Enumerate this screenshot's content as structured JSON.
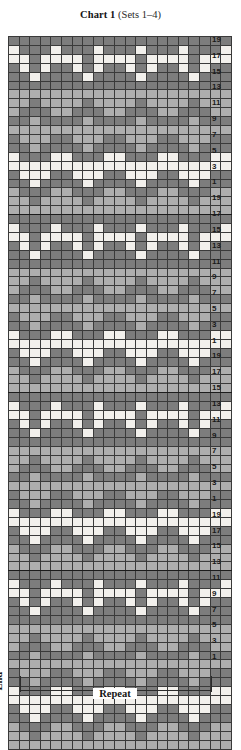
{
  "title": {
    "main": "Chart 1",
    "sub": "(Sets 1–4)"
  },
  "legend": {
    "end_label": "End",
    "repeat_label": "Repeat"
  },
  "colors": {
    "light": "#f2f0ec",
    "medium": "#aeaeae",
    "dark": "#7d7d7d",
    "grid_line": "#3a3a3a",
    "border": "#2b2b2b",
    "text": "#141414"
  },
  "chart_data": {
    "type": "heatmap",
    "title": "Chart 1 (Sets 1–4)",
    "xlabel": "",
    "ylabel": "",
    "columns": 21,
    "rows": 80,
    "sets": 4,
    "rows_per_set": 20,
    "stitch_repeat": 6,
    "palette": [
      "#f2f0ec",
      "#aeaeae",
      "#7d7d7d"
    ],
    "palette_names": [
      "light",
      "medium",
      "dark"
    ],
    "row_number_labels": [
      19,
      17,
      15,
      13,
      11,
      9,
      7,
      5,
      3,
      1
    ],
    "grid": "on",
    "legend_position": "bottom",
    "annotations": [
      "End",
      "Repeat"
    ],
    "set_pattern": [
      [
        2,
        2,
        2,
        2,
        2,
        2,
        2,
        2,
        2,
        2,
        2,
        2,
        2,
        2,
        2,
        2,
        2,
        2,
        2,
        2,
        2
      ],
      [
        0,
        2,
        2,
        2,
        0,
        2,
        2,
        2,
        0,
        2,
        2,
        2,
        0,
        2,
        2,
        2,
        0,
        2,
        2,
        2,
        0
      ],
      [
        0,
        0,
        2,
        0,
        0,
        0,
        0,
        2,
        0,
        0,
        0,
        0,
        2,
        0,
        0,
        0,
        0,
        2,
        0,
        0,
        0
      ],
      [
        2,
        0,
        2,
        0,
        2,
        2,
        0,
        2,
        0,
        2,
        2,
        0,
        2,
        0,
        2,
        2,
        0,
        2,
        0,
        2,
        2
      ],
      [
        2,
        2,
        0,
        2,
        2,
        2,
        2,
        0,
        2,
        2,
        2,
        2,
        0,
        2,
        2,
        2,
        2,
        0,
        2,
        2,
        2
      ],
      [
        2,
        2,
        2,
        2,
        2,
        2,
        2,
        2,
        2,
        2,
        2,
        2,
        2,
        2,
        2,
        2,
        2,
        2,
        2,
        2,
        2
      ],
      [
        1,
        1,
        1,
        1,
        1,
        1,
        1,
        1,
        1,
        1,
        1,
        1,
        1,
        1,
        1,
        1,
        1,
        1,
        1,
        1,
        1
      ],
      [
        1,
        1,
        2,
        1,
        1,
        1,
        1,
        2,
        1,
        1,
        1,
        1,
        2,
        1,
        1,
        1,
        1,
        2,
        1,
        1,
        1
      ],
      [
        1,
        2,
        2,
        2,
        1,
        1,
        2,
        2,
        2,
        1,
        1,
        2,
        2,
        2,
        1,
        1,
        2,
        2,
        2,
        1,
        1
      ],
      [
        2,
        2,
        1,
        2,
        2,
        2,
        2,
        1,
        2,
        2,
        2,
        2,
        1,
        2,
        2,
        2,
        2,
        1,
        2,
        2,
        2
      ],
      [
        1,
        1,
        1,
        1,
        1,
        1,
        1,
        1,
        1,
        1,
        1,
        1,
        1,
        1,
        1,
        1,
        1,
        1,
        1,
        1,
        1
      ],
      [
        2,
        1,
        1,
        1,
        2,
        2,
        1,
        1,
        1,
        2,
        2,
        1,
        1,
        1,
        2,
        2,
        1,
        1,
        1,
        2,
        2
      ],
      [
        2,
        2,
        1,
        2,
        2,
        2,
        2,
        1,
        2,
        2,
        2,
        2,
        1,
        2,
        2,
        2,
        2,
        1,
        2,
        2,
        2
      ],
      [
        0,
        2,
        2,
        2,
        0,
        0,
        2,
        2,
        2,
        0,
        0,
        2,
        2,
        2,
        0,
        0,
        2,
        2,
        2,
        0,
        0
      ],
      [
        0,
        0,
        0,
        0,
        0,
        0,
        0,
        0,
        0,
        0,
        0,
        0,
        0,
        0,
        0,
        0,
        0,
        0,
        0,
        0,
        0
      ],
      [
        2,
        0,
        0,
        0,
        2,
        2,
        0,
        0,
        0,
        2,
        2,
        0,
        0,
        0,
        2,
        2,
        0,
        0,
        0,
        2,
        2
      ],
      [
        2,
        2,
        0,
        2,
        2,
        2,
        2,
        0,
        2,
        2,
        2,
        2,
        0,
        2,
        2,
        2,
        2,
        0,
        2,
        2,
        2
      ],
      [
        1,
        2,
        2,
        2,
        1,
        1,
        2,
        2,
        2,
        1,
        1,
        2,
        2,
        2,
        1,
        1,
        2,
        2,
        2,
        1,
        1
      ],
      [
        1,
        1,
        2,
        1,
        1,
        1,
        1,
        2,
        1,
        1,
        1,
        1,
        2,
        1,
        1,
        1,
        1,
        2,
        1,
        1,
        1
      ],
      [
        1,
        1,
        1,
        1,
        1,
        1,
        1,
        1,
        1,
        1,
        1,
        1,
        1,
        1,
        1,
        1,
        1,
        1,
        1,
        1,
        1
      ]
    ]
  }
}
